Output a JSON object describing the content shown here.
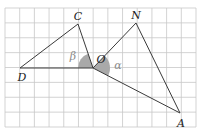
{
  "figure": {
    "grid": {
      "left": 5,
      "top": 8,
      "right": 196,
      "bottom": 127,
      "cols": 13,
      "rows": 8,
      "line_color": "#c8c8c8",
      "border_color": "#b4b4b4"
    },
    "colors": {
      "line": "#3a3a3a",
      "sector_fill": "#a9a9a9",
      "label": "#222222",
      "greek_label": "#8a8a8a"
    },
    "points": {
      "C": {
        "x": 78,
        "y": 24,
        "label": "C",
        "lx": 78,
        "ly": 20
      },
      "N": {
        "x": 136,
        "y": 23,
        "label": "N",
        "lx": 136,
        "ly": 19
      },
      "O": {
        "x": 93,
        "y": 68,
        "label": "O",
        "lx": 101,
        "ly": 63
      },
      "D": {
        "x": 20,
        "y": 68,
        "label": "D",
        "lx": 22,
        "ly": 81
      },
      "A": {
        "x": 180,
        "y": 113,
        "label": "A",
        "lx": 181,
        "ly": 127
      }
    },
    "segments": [
      [
        "D",
        "C"
      ],
      [
        "C",
        "O"
      ],
      [
        "D",
        "O"
      ],
      [
        "O",
        "N"
      ],
      [
        "N",
        "A"
      ],
      [
        "O",
        "A"
      ]
    ],
    "angles": [
      {
        "name": "beta",
        "symbol": "β",
        "vertex": "O",
        "from": "D",
        "to": "C",
        "radius": 15,
        "lx": 73,
        "ly": 60
      },
      {
        "name": "alpha",
        "symbol": "α",
        "vertex": "O",
        "from": "N",
        "to": "A",
        "radius": 17,
        "lx": 118,
        "ly": 69
      }
    ]
  }
}
